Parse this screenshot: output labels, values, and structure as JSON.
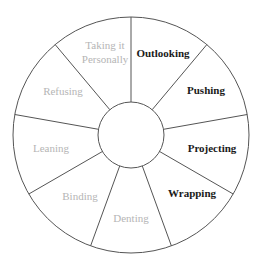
{
  "diagram": {
    "type": "segmented-wheel",
    "segment_count": 9,
    "colors": {
      "line": "#555555",
      "active_text": "#1a1a1a",
      "inactive_text": "#b5b5b5",
      "background": "#ffffff"
    },
    "segments": [
      {
        "label": "Outlooking",
        "lines": [
          "Outlooking"
        ],
        "active": true
      },
      {
        "label": "Pushing",
        "lines": [
          "Pushing"
        ],
        "active": true
      },
      {
        "label": "Projecting",
        "lines": [
          "Projecting"
        ],
        "active": true
      },
      {
        "label": "Wrapping",
        "lines": [
          "Wrapping"
        ],
        "active": true
      },
      {
        "label": "Denting",
        "lines": [
          "Denting"
        ],
        "active": false
      },
      {
        "label": "Binding",
        "lines": [
          "Binding"
        ],
        "active": false
      },
      {
        "label": "Leaning",
        "lines": [
          "Leaning"
        ],
        "active": false
      },
      {
        "label": "Refusing",
        "lines": [
          "Refusing"
        ],
        "active": false
      },
      {
        "label": "Taking it Personally",
        "lines": [
          "Taking it",
          "Personally"
        ],
        "active": false
      }
    ]
  }
}
